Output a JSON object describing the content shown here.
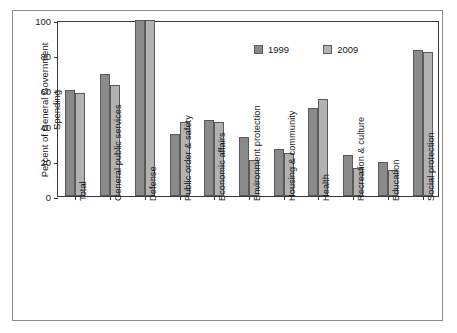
{
  "chart_data": {
    "type": "bar",
    "title": "",
    "xlabel": "",
    "ylabel": "Percent of General Government Spending",
    "ylim": [
      0,
      100
    ],
    "yticks": [
      0,
      20,
      40,
      60,
      80,
      100
    ],
    "grid": false,
    "legend_position": "top-center",
    "categories": [
      "Total",
      "General public services",
      "Defense",
      "Public order & safety",
      "Economic affairs",
      "Environment protection",
      "Housing & community",
      "Health",
      "Recreation & culture",
      "Education",
      "Social protection"
    ],
    "series": [
      {
        "name": "1999",
        "color": "#8a8a8a",
        "values": [
          60.5,
          69.5,
          100,
          35.3,
          43,
          33.7,
          26.6,
          49.8,
          23.2,
          19.2,
          83
        ]
      },
      {
        "name": "2009",
        "color": "#b2b2b2",
        "values": [
          58.6,
          62.8,
          100,
          42.2,
          42.2,
          20.6,
          24.2,
          55.4,
          16.1,
          14.5,
          81.6
        ]
      }
    ]
  },
  "legend": {
    "items": [
      {
        "label": "1999"
      },
      {
        "label": "2009"
      }
    ]
  },
  "axis": {
    "y_label": "Percent of General Government Spending",
    "y_ticks": [
      "100",
      "80",
      "60",
      "40",
      "20",
      "0"
    ]
  }
}
